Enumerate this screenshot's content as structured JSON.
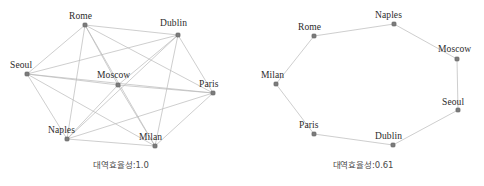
{
  "figure": {
    "width": 484,
    "height": 186,
    "background": "#ffffff",
    "node_color": "#7c7c7c",
    "node_edge_color": "#5a5a5a",
    "edge_color": "#b9b9b9",
    "label_color": "#2b2b2b",
    "caption_color": "#4a4a4a"
  },
  "chart_data": {
    "type": "scatter",
    "title": "",
    "xlabel": "",
    "ylabel": "",
    "grid": false,
    "legend": null,
    "panels": [
      {
        "id": "complete-graph",
        "caption": "대역효율성:1.0",
        "efficiency_label": "대역효율성",
        "efficiency_value": "1.0",
        "topology": "complete",
        "node_count": 8,
        "edge_count": 28,
        "nodes": [
          {
            "id": "Rome",
            "label": "Rome",
            "x": 85,
            "y": 25,
            "label_x": 69,
            "label_y": 12
          },
          {
            "id": "Dublin",
            "label": "Dublin",
            "x": 178,
            "y": 35,
            "label_x": 160,
            "label_y": 19
          },
          {
            "id": "Seoul",
            "label": "Seoul",
            "x": 27,
            "y": 74,
            "label_x": 10,
            "label_y": 61
          },
          {
            "id": "Moscow",
            "label": "Moscow",
            "x": 118,
            "y": 85,
            "label_x": 97,
            "label_y": 71
          },
          {
            "id": "Paris",
            "label": "Paris",
            "x": 213,
            "y": 93,
            "label_x": 199,
            "label_y": 80
          },
          {
            "id": "Naples",
            "label": "Naples",
            "x": 67,
            "y": 139,
            "label_x": 48,
            "label_y": 126
          },
          {
            "id": "Milan",
            "label": "Milan",
            "x": 155,
            "y": 146,
            "label_x": 139,
            "label_y": 133
          }
        ],
        "extra_nodes": [],
        "edges": [
          [
            "Rome",
            "Dublin"
          ],
          [
            "Rome",
            "Seoul"
          ],
          [
            "Rome",
            "Moscow"
          ],
          [
            "Rome",
            "Paris"
          ],
          [
            "Rome",
            "Naples"
          ],
          [
            "Rome",
            "Milan"
          ],
          [
            "Dublin",
            "Seoul"
          ],
          [
            "Dublin",
            "Moscow"
          ],
          [
            "Dublin",
            "Paris"
          ],
          [
            "Dublin",
            "Naples"
          ],
          [
            "Dublin",
            "Milan"
          ],
          [
            "Seoul",
            "Moscow"
          ],
          [
            "Seoul",
            "Paris"
          ],
          [
            "Seoul",
            "Naples"
          ],
          [
            "Seoul",
            "Milan"
          ],
          [
            "Moscow",
            "Paris"
          ],
          [
            "Moscow",
            "Naples"
          ],
          [
            "Moscow",
            "Milan"
          ],
          [
            "Paris",
            "Naples"
          ],
          [
            "Paris",
            "Milan"
          ],
          [
            "Naples",
            "Milan"
          ]
        ]
      },
      {
        "id": "ring-graph",
        "caption": "대역효율성:0.61",
        "efficiency_label": "대역효율성",
        "efficiency_value": "0.61",
        "topology": "ring",
        "node_count": 8,
        "edge_count": 8,
        "nodes": [
          {
            "id": "Naples",
            "label": "Naples",
            "x": 152,
            "y": 24,
            "label_x": 133,
            "label_y": 11
          },
          {
            "id": "Rome",
            "label": "Rome",
            "x": 72,
            "y": 36,
            "label_x": 56,
            "label_y": 23
          },
          {
            "id": "Moscow",
            "label": "Moscow",
            "x": 215,
            "y": 59,
            "label_x": 196,
            "label_y": 45
          },
          {
            "id": "Milan",
            "label": "Milan",
            "x": 34,
            "y": 84,
            "label_x": 19,
            "label_y": 71
          },
          {
            "id": "Seoul",
            "label": "Seoul",
            "x": 216,
            "y": 110,
            "label_x": 200,
            "label_y": 98
          },
          {
            "id": "Paris",
            "label": "Paris",
            "x": 72,
            "y": 134,
            "label_x": 57,
            "label_y": 121
          },
          {
            "id": "Dublin",
            "label": "Dublin",
            "x": 151,
            "y": 145,
            "label_x": 133,
            "label_y": 132
          }
        ],
        "edges": [
          [
            "Rome",
            "Naples"
          ],
          [
            "Naples",
            "Moscow"
          ],
          [
            "Moscow",
            "Seoul"
          ],
          [
            "Seoul",
            "Dublin"
          ],
          [
            "Dublin",
            "Paris"
          ],
          [
            "Paris",
            "Milan"
          ],
          [
            "Milan",
            "Rome"
          ]
        ]
      }
    ]
  }
}
